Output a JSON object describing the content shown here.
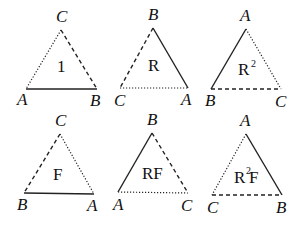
{
  "diagram": {
    "triangles": [
      {
        "id": "identity",
        "center_label": "1",
        "center_sup": "",
        "center_suffix": "",
        "apex": "C",
        "bottom_left": "A",
        "bottom_right": "B",
        "edges": {
          "left": "dotted",
          "right": "dashed",
          "bottom": "solid"
        }
      },
      {
        "id": "R",
        "center_label": "R",
        "center_sup": "",
        "center_suffix": "",
        "apex": "B",
        "bottom_left": "C",
        "bottom_right": "A",
        "edges": {
          "left": "dashed",
          "right": "solid",
          "bottom": "dotted"
        }
      },
      {
        "id": "R2",
        "center_label": "R",
        "center_sup": "2",
        "center_suffix": "",
        "apex": "A",
        "bottom_left": "B",
        "bottom_right": "C",
        "edges": {
          "left": "solid",
          "right": "dotted",
          "bottom": "dashed"
        }
      },
      {
        "id": "F",
        "center_label": "F",
        "center_sup": "",
        "center_suffix": "",
        "apex": "C",
        "bottom_left": "B",
        "bottom_right": "A",
        "edges": {
          "left": "dashed",
          "right": "dotted",
          "bottom": "solid"
        }
      },
      {
        "id": "RF",
        "center_label": "RF",
        "center_sup": "",
        "center_suffix": "",
        "apex": "B",
        "bottom_left": "A",
        "bottom_right": "C",
        "edges": {
          "left": "solid",
          "right": "dashed",
          "bottom": "dotted"
        }
      },
      {
        "id": "R2F",
        "center_label": "R",
        "center_sup": "2",
        "center_suffix": "F",
        "apex": "A",
        "bottom_left": "C",
        "bottom_right": "B",
        "edges": {
          "left": "dotted",
          "right": "solid",
          "bottom": "dashed"
        }
      }
    ]
  }
}
